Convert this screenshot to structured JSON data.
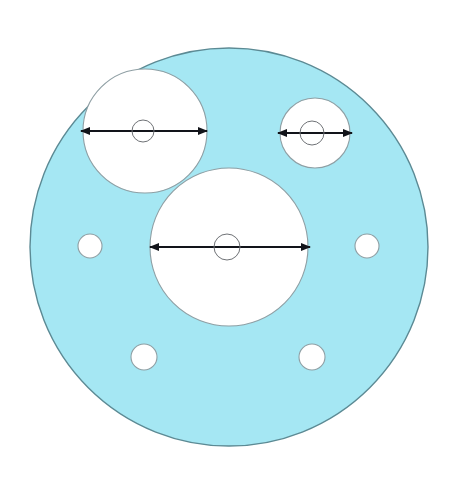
{
  "canvas": {
    "width": 455,
    "height": 478,
    "background": "#ffffff"
  },
  "colors": {
    "body_fill": "#a5e7f3",
    "body_stroke": "#5c8a94",
    "hole_fill": "#ffffff",
    "hole_stroke": "#8f9fa4",
    "dimension_line": "#12141a",
    "center_mark_stroke": "#6f7276"
  },
  "chart_data": {
    "type": "diagram",
    "units": "px",
    "shapes": [
      {
        "name": "gasket-body",
        "kind": "circle",
        "cx": 229,
        "cy": 247,
        "r": 199,
        "fill": "#a5e7f3",
        "stroke": "#5c8a94",
        "stroke_width": 1.4
      },
      {
        "name": "bore-top-left",
        "kind": "circle",
        "cx": 145,
        "cy": 131,
        "r": 62,
        "fill": "#ffffff",
        "stroke": "#8f9fa4",
        "stroke_width": 1.1,
        "dimensioned": true
      },
      {
        "name": "bore-top-right",
        "kind": "circle",
        "cx": 315,
        "cy": 133,
        "r": 35,
        "fill": "#ffffff",
        "stroke": "#8f9fa4",
        "stroke_width": 1.1,
        "dimensioned": true
      },
      {
        "name": "bore-center-main",
        "kind": "circle",
        "cx": 229,
        "cy": 247,
        "r": 79,
        "fill": "#ffffff",
        "stroke": "#8f9fa4",
        "stroke_width": 1.1,
        "dimensioned": true
      },
      {
        "name": "bolt-hole-left",
        "kind": "circle",
        "cx": 90,
        "cy": 246,
        "r": 12,
        "fill": "#ffffff",
        "stroke": "#8f9fa4",
        "stroke_width": 1.1,
        "dimensioned": false
      },
      {
        "name": "bolt-hole-right",
        "kind": "circle",
        "cx": 367,
        "cy": 246,
        "r": 12,
        "fill": "#ffffff",
        "stroke": "#8f9fa4",
        "stroke_width": 1.1,
        "dimensioned": false
      },
      {
        "name": "bolt-hole-bottom-left",
        "kind": "circle",
        "cx": 144,
        "cy": 357,
        "r": 13,
        "fill": "#ffffff",
        "stroke": "#8f9fa4",
        "stroke_width": 1.1,
        "dimensioned": false
      },
      {
        "name": "bolt-hole-bottom-right",
        "kind": "circle",
        "cx": 312,
        "cy": 357,
        "r": 13,
        "fill": "#ffffff",
        "stroke": "#8f9fa4",
        "stroke_width": 1.1,
        "dimensioned": false
      }
    ],
    "center_marks": [
      {
        "name": "center-mark-top-left",
        "cx": 143,
        "cy": 131,
        "r": 11
      },
      {
        "name": "center-mark-top-right",
        "cx": 312,
        "cy": 133,
        "r": 12
      },
      {
        "name": "center-mark-main",
        "cx": 227,
        "cy": 247,
        "r": 13
      }
    ],
    "dimensions": [
      {
        "name": "diameter-top-left",
        "for_shape": "bore-top-left",
        "y": 131,
        "x1": 81,
        "x2": 207,
        "length": 126,
        "label": "",
        "arrow_both_ends": true
      },
      {
        "name": "diameter-top-right",
        "for_shape": "bore-top-right",
        "y": 133,
        "x1": 278,
        "x2": 352,
        "length": 74,
        "label": "",
        "arrow_both_ends": true
      },
      {
        "name": "diameter-main-bore",
        "for_shape": "bore-center-main",
        "y": 247,
        "x1": 150,
        "x2": 310,
        "length": 160,
        "label": "",
        "arrow_both_ends": true
      }
    ]
  }
}
